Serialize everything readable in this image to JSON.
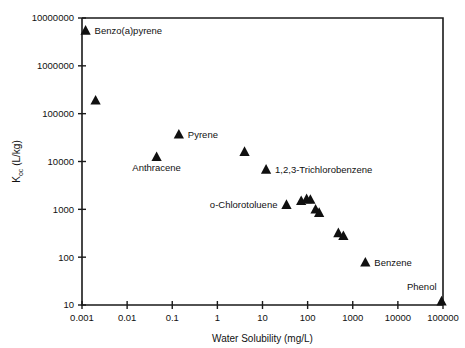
{
  "chart_data": {
    "type": "scatter",
    "title": "",
    "xlabel": "Water Solubility (mg/L)",
    "ylabel": "Koc (L/kg)",
    "ylabel_base": "K",
    "ylabel_sub": "oc",
    "ylabel_unit": " (L/kg)",
    "xscale": "log",
    "yscale": "log",
    "xlim": [
      0.001,
      100000
    ],
    "ylim": [
      10,
      10000000
    ],
    "grid": false,
    "legend": "none",
    "xticks": [
      "0.001",
      "0.01",
      "0.1",
      "1",
      "10",
      "100",
      "1000",
      "10000",
      "100000"
    ],
    "xtick_values": [
      0.001,
      0.01,
      0.1,
      1,
      10,
      100,
      1000,
      10000,
      100000
    ],
    "yticks": [
      "10",
      "100",
      "1000",
      "10000",
      "100000",
      "1000000",
      "10000000"
    ],
    "ytick_values": [
      10,
      100,
      1000,
      10000,
      100000,
      1000000,
      10000000
    ],
    "marker_shape": "triangle-up",
    "marker_color": "#101010",
    "points": [
      {
        "x": 0.0012,
        "y": 5500000,
        "label": "Benzo(a)pyrene",
        "label_pos": "right"
      },
      {
        "x": 0.002,
        "y": 190000,
        "label": "",
        "label_pos": "none"
      },
      {
        "x": 0.14,
        "y": 37000,
        "label": "Pyrene",
        "label_pos": "right"
      },
      {
        "x": 0.045,
        "y": 12500,
        "label": "Anthracene",
        "label_pos": "below"
      },
      {
        "x": 4.0,
        "y": 16000,
        "label": "",
        "label_pos": "none"
      },
      {
        "x": 12.0,
        "y": 6800,
        "label": "1,2,3-Trichlorobenzene",
        "label_pos": "right"
      },
      {
        "x": 34.0,
        "y": 1250,
        "label": "o-Chlorotoluene",
        "label_pos": "left"
      },
      {
        "x": 72.0,
        "y": 1500,
        "label": "",
        "label_pos": "none"
      },
      {
        "x": 95.0,
        "y": 1650,
        "label": "",
        "label_pos": "none"
      },
      {
        "x": 115.0,
        "y": 1600,
        "label": "",
        "label_pos": "none"
      },
      {
        "x": 150.0,
        "y": 1000,
        "label": "",
        "label_pos": "none"
      },
      {
        "x": 180.0,
        "y": 850,
        "label": "",
        "label_pos": "none"
      },
      {
        "x": 480.0,
        "y": 320,
        "label": "",
        "label_pos": "none"
      },
      {
        "x": 620.0,
        "y": 280,
        "label": "",
        "label_pos": "none"
      },
      {
        "x": 1900.0,
        "y": 78,
        "label": "Benzene",
        "label_pos": "right"
      },
      {
        "x": 93000.0,
        "y": 12,
        "label": "Phenol",
        "label_pos": "above-left"
      }
    ]
  },
  "colors": {
    "axis": "#1a1a1a",
    "marker": "#101010",
    "text": "#111111",
    "background": "#ffffff"
  }
}
